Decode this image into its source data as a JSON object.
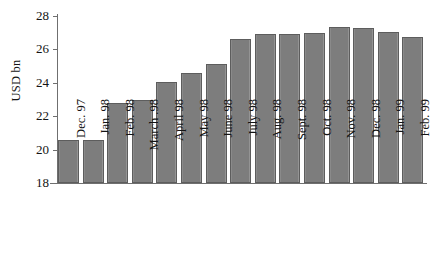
{
  "chart_data": {
    "type": "bar",
    "title": "",
    "subtitle": "",
    "xlabel": "",
    "ylabel": "USD bn",
    "ylim": [
      18,
      28
    ],
    "ytick_step": 2,
    "yticks": [
      28,
      26,
      24,
      22,
      20,
      18
    ],
    "grid": false,
    "legend": false,
    "bar_color": "#7d7d7d",
    "bar_border_color": "#5d5d5d",
    "axis_color": "#6f6f6f",
    "categories": [
      "Dec. 97",
      "Jan. 98",
      "Feb. 98",
      "March .98",
      "April 98",
      "May 98",
      "June 98",
      "July 98",
      "Aug. 98",
      "Sept. 98",
      "Oct. 98",
      "Nov. 98",
      "Dec. 98",
      "Jan. 99",
      "Feb. 99"
    ],
    "values": [
      20.55,
      20.55,
      22.8,
      22.95,
      24.05,
      24.6,
      25.15,
      26.6,
      26.9,
      26.95,
      27.0,
      27.35,
      27.3,
      27.05,
      26.75
    ]
  }
}
